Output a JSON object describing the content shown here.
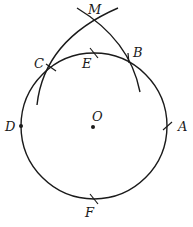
{
  "diagram": {
    "type": "geometric-construction",
    "circle": {
      "center_label": "O",
      "cx": 94,
      "cy": 126,
      "r": 73
    },
    "points": {
      "O": {
        "label": "O",
        "x": 94,
        "y": 126,
        "lx": 94,
        "ly": 120,
        "marker": "dot"
      },
      "A": {
        "label": "A",
        "x": 168,
        "y": 126,
        "lx": 178,
        "ly": 131,
        "marker": "tick"
      },
      "B": {
        "label": "B",
        "x": 128,
        "y": 58,
        "lx": 133,
        "ly": 56,
        "marker": "tick"
      },
      "C": {
        "label": "C",
        "x": 51,
        "y": 67,
        "lx": 35,
        "ly": 69,
        "marker": "tick"
      },
      "D": {
        "label": "D",
        "x": 21,
        "y": 126,
        "lx": 5,
        "ly": 131,
        "marker": "dot"
      },
      "E": {
        "label": "E",
        "x": 94,
        "y": 53,
        "lx": 82,
        "ly": 66,
        "marker": "tick"
      },
      "F": {
        "label": "F",
        "x": 94,
        "y": 199,
        "lx": 85,
        "ly": 217,
        "marker": "tick"
      },
      "M": {
        "label": "M",
        "x": 93,
        "y": 20,
        "lx": 88,
        "ly": 12,
        "marker": "none"
      }
    },
    "arcs": [
      {
        "name": "arc-centered-at-B",
        "through": [
          "C",
          "M"
        ]
      },
      {
        "name": "arc-centered-at-C",
        "through": [
          "B",
          "M"
        ]
      }
    ]
  }
}
